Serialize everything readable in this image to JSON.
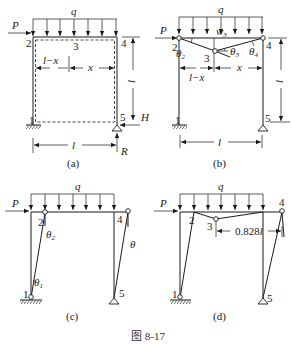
{
  "figure": {
    "caption": "图 8-17",
    "panels": [
      {
        "id": "a",
        "label": "(a)",
        "load_label": "q",
        "force_label": "P",
        "node_labels": [
          "1",
          "2",
          "3",
          "4",
          "5"
        ],
        "dim_left": "l−x",
        "dim_right": "x",
        "dim_height": "l",
        "dim_span": "l",
        "reaction_h": "H",
        "reaction_v": "R"
      },
      {
        "id": "b",
        "label": "(b)",
        "load_label": "q",
        "force_label": "P",
        "node_labels": [
          "1",
          "2",
          "3",
          "4",
          "5"
        ],
        "theta2": "θ",
        "theta2_sub": "2",
        "theta3": "θ",
        "theta3_sub": "3",
        "theta4": "θ",
        "theta4_sub": "4",
        "w3": "w",
        "w3_sub": "3",
        "dim_left": "l−x",
        "dim_right": "x",
        "dim_height": "l",
        "dim_span": "l"
      },
      {
        "id": "c",
        "label": "(c)",
        "load_label": "q",
        "force_label": "P",
        "node_labels": [
          "1",
          "2",
          "4",
          "5"
        ],
        "theta1": "θ",
        "theta1_sub": "1",
        "theta2": "θ",
        "theta2_sub": "2",
        "theta": "θ"
      },
      {
        "id": "d",
        "label": "(d)",
        "load_label": "q",
        "force_label": "P",
        "node_labels": [
          "1",
          "2",
          "3",
          "4",
          "5"
        ],
        "dim_value": "0.828",
        "dim_unit": "l"
      }
    ]
  }
}
